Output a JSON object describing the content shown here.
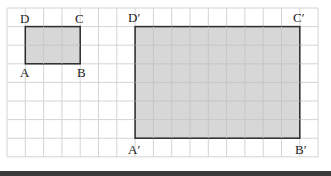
{
  "figure": {
    "grid": {
      "columns": 17,
      "rows": 8,
      "line_color": "#d4d4d4",
      "background": "#ffffff"
    },
    "fill_color": "#d3d3d3",
    "stroke_color": "#2a2a2a",
    "small_rectangle": {
      "vertices": {
        "A": "A",
        "B": "B",
        "C": "C",
        "D": "D"
      },
      "grid_x": [
        1,
        4
      ],
      "grid_y": [
        1,
        3
      ]
    },
    "large_rectangle": {
      "vertices": {
        "A": "A′",
        "B": "B′",
        "C": "C′",
        "D": "D′"
      },
      "grid_x": [
        7,
        16
      ],
      "grid_y": [
        1,
        7
      ]
    }
  }
}
